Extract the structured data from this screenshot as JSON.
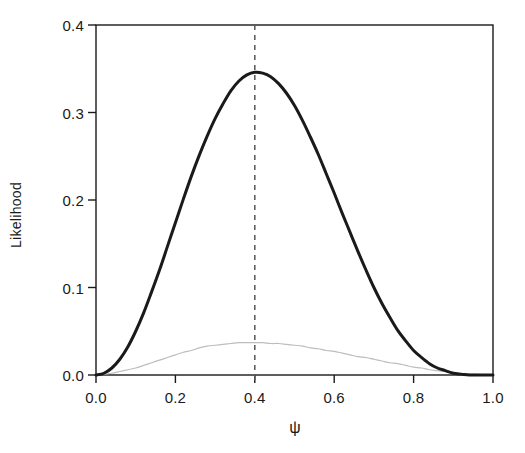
{
  "chart_data": {
    "type": "line",
    "title": "",
    "subtitle": "",
    "xlabel": "ψ",
    "ylabel": "Likelihood",
    "xlim": [
      0.0,
      1.0
    ],
    "ylim": [
      0.0,
      0.4
    ],
    "xticks": [
      0.0,
      0.2,
      0.4,
      0.6,
      0.8,
      1.0
    ],
    "xtick_labels": [
      "0.0",
      "0.2",
      "0.4",
      "0.6",
      "0.8",
      "1.0"
    ],
    "yticks": [
      0.0,
      0.1,
      0.2,
      0.3,
      0.4
    ],
    "ytick_labels": [
      "0.0",
      "0.1",
      "0.2",
      "0.3",
      "0.4"
    ],
    "grid": false,
    "legend": null,
    "frame": "box",
    "tick_direction": "out",
    "annotations": [
      {
        "name": "mle-vertical-dashed-line",
        "type": "vline",
        "x": 0.4,
        "style": "dashed",
        "color": "#555555",
        "label": ""
      }
    ],
    "series": [
      {
        "name": "likelihood-main",
        "style": "solid",
        "color": "#1a1a1a",
        "width": 3.0,
        "peak_x": 0.4,
        "peak_y": 0.346,
        "x": [
          0.0,
          0.02,
          0.04,
          0.06,
          0.08,
          0.1,
          0.12,
          0.14,
          0.16,
          0.18,
          0.2,
          0.22,
          0.24,
          0.26,
          0.28,
          0.3,
          0.32,
          0.34,
          0.36,
          0.38,
          0.4,
          0.42,
          0.44,
          0.46,
          0.48,
          0.5,
          0.52,
          0.54,
          0.56,
          0.58,
          0.6,
          0.62,
          0.64,
          0.66,
          0.68,
          0.7,
          0.72,
          0.74,
          0.76,
          0.78,
          0.8,
          0.82,
          0.84,
          0.86,
          0.88,
          0.9,
          0.92,
          0.94,
          0.96,
          0.98,
          1.0
        ],
        "y": [
          0.0,
          0.002,
          0.008,
          0.018,
          0.032,
          0.05,
          0.071,
          0.095,
          0.12,
          0.147,
          0.174,
          0.201,
          0.227,
          0.251,
          0.273,
          0.293,
          0.31,
          0.325,
          0.336,
          0.343,
          0.346,
          0.345,
          0.341,
          0.333,
          0.322,
          0.308,
          0.291,
          0.272,
          0.252,
          0.23,
          0.208,
          0.185,
          0.163,
          0.141,
          0.12,
          0.1,
          0.082,
          0.066,
          0.051,
          0.039,
          0.028,
          0.02,
          0.013,
          0.008,
          0.005,
          0.002,
          0.001,
          0.0,
          0.0,
          0.0,
          0.0
        ]
      },
      {
        "name": "likelihood-secondary-faint",
        "style": "solid",
        "color": "#bdbdbd",
        "width": 1.2,
        "peak_x": 0.39,
        "peak_y": 0.037,
        "x": [
          0.0,
          0.02,
          0.04,
          0.06,
          0.08,
          0.1,
          0.12,
          0.14,
          0.16,
          0.18,
          0.2,
          0.22,
          0.24,
          0.26,
          0.28,
          0.3,
          0.32,
          0.34,
          0.36,
          0.38,
          0.4,
          0.42,
          0.44,
          0.46,
          0.48,
          0.5,
          0.52,
          0.54,
          0.56,
          0.58,
          0.6,
          0.62,
          0.64,
          0.66,
          0.68,
          0.7,
          0.72,
          0.74,
          0.76,
          0.78,
          0.8,
          0.82,
          0.84,
          0.86,
          0.88,
          0.9,
          0.92,
          0.94,
          0.96,
          0.98,
          1.0
        ],
        "y": [
          0.0,
          0.001,
          0.002,
          0.004,
          0.006,
          0.008,
          0.011,
          0.014,
          0.017,
          0.02,
          0.023,
          0.026,
          0.028,
          0.031,
          0.033,
          0.034,
          0.035,
          0.036,
          0.037,
          0.037,
          0.037,
          0.037,
          0.036,
          0.036,
          0.035,
          0.034,
          0.033,
          0.031,
          0.03,
          0.028,
          0.027,
          0.025,
          0.023,
          0.021,
          0.02,
          0.018,
          0.016,
          0.014,
          0.013,
          0.011,
          0.009,
          0.008,
          0.006,
          0.005,
          0.004,
          0.003,
          0.002,
          0.001,
          0.001,
          0.0,
          0.0
        ]
      }
    ]
  },
  "axes": {
    "ylabel_text": "Likelihood",
    "xlabel_text": "ψ",
    "ytick_labels": [
      "0.0",
      "0.1",
      "0.2",
      "0.3",
      "0.4"
    ],
    "xtick_labels": [
      "0.0",
      "0.2",
      "0.4",
      "0.6",
      "0.8",
      "1.0"
    ]
  },
  "colors": {
    "background": "#ffffff",
    "axis": "#1a1a1a",
    "main_curve": "#1a1a1a",
    "faint_curve": "#bdbdbd",
    "dashed_line": "#555555"
  }
}
